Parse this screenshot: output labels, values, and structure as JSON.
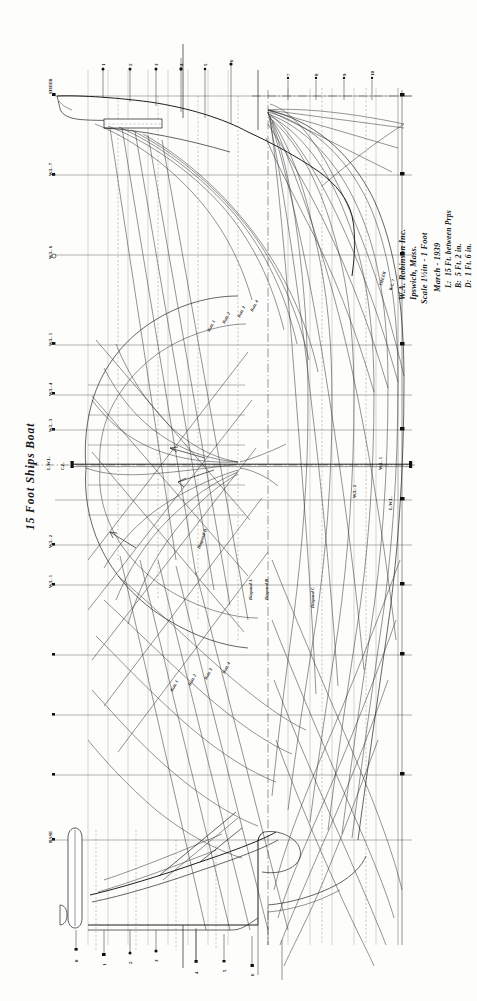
{
  "sheet": {
    "background_color": "#fdfdfc",
    "ink_color": "#151515",
    "width": 477,
    "height": 1001
  },
  "drawing": {
    "type": "naval-architecture-lines-plan",
    "title": "15 Foot  Ships Boat",
    "orientation": "landscape-drawing-rotated-90-in-portrait-frame"
  },
  "title_block": {
    "company": "W.A. Robinson Inc.",
    "location": "Ipswich, Mass.",
    "scale": "Scale 1½in - 1 Foot",
    "date": "March - 1939",
    "specs": [
      {
        "key": "L:",
        "value": "15 Ft. between Prps"
      },
      {
        "key": "B:",
        "value": "5 Ft. 2 in."
      },
      {
        "key": "D:",
        "value": "1 Ft. 6 in."
      }
    ]
  },
  "views": [
    {
      "name": "sheer-plan",
      "label": "Sheer Plan (profile)"
    },
    {
      "name": "body-plan",
      "label": "Body Plan (sections)"
    },
    {
      "name": "half-breadth-plan",
      "label": "Half Breadth Plan"
    }
  ],
  "stations": {
    "label": "Station",
    "numbers": [
      "0",
      "1",
      "2",
      "3",
      "4",
      "5",
      "6",
      "7",
      "8",
      "9",
      "10"
    ]
  },
  "waterlines": {
    "label": "Waterline",
    "entries": [
      {
        "id": "wl-sheer",
        "label": "SHEER"
      },
      {
        "id": "wl-7",
        "label": "W.L. 7"
      },
      {
        "id": "wl-6",
        "label": "W.L. 6"
      },
      {
        "id": "wl-5",
        "label": "W.L. 5"
      },
      {
        "id": "wl-4",
        "label": "W.L. 4"
      },
      {
        "id": "wl-3",
        "label": "W.L. 3"
      },
      {
        "id": "wl-2",
        "label": "W.L. 2"
      },
      {
        "id": "wl-1",
        "label": "W.L. 1"
      },
      {
        "id": "lwl",
        "label": "L.W.L."
      },
      {
        "id": "base",
        "label": "BASE"
      }
    ]
  },
  "buttocks": {
    "label": "Buttock",
    "entries": [
      {
        "id": "butt-1",
        "label": "Butt. 1"
      },
      {
        "id": "butt-2",
        "label": "Butt. 2"
      },
      {
        "id": "butt-3",
        "label": "Butt. 3"
      },
      {
        "id": "butt-4",
        "label": "Butt. 4"
      }
    ]
  },
  "diagonals": {
    "label": "Diagonal",
    "entries": [
      {
        "id": "diag-a",
        "label": "Diagonal A"
      },
      {
        "id": "diag-b",
        "label": "Diagonal B"
      },
      {
        "id": "diag-c",
        "label": "Diagonal C"
      },
      {
        "id": "diag-d",
        "label": "Diagonal D"
      }
    ]
  },
  "details": [
    {
      "id": "stem",
      "label": "Stem"
    },
    {
      "id": "keel",
      "label": "Keel"
    },
    {
      "id": "rudder",
      "label": "Rudder"
    },
    {
      "id": "transom",
      "label": "Transom"
    },
    {
      "id": "centerline",
      "label": "C.L."
    }
  ]
}
